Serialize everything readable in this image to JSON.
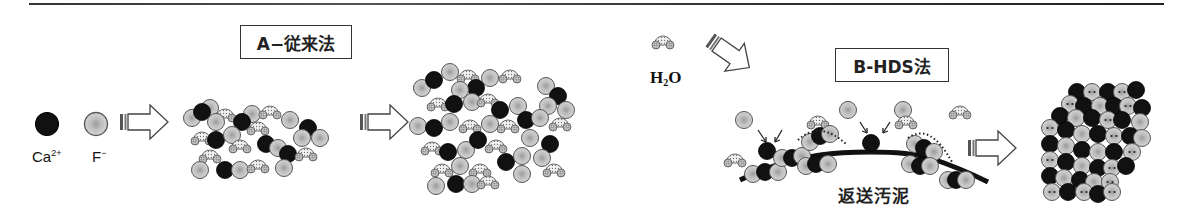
{
  "diagram": {
    "title_a": "A−従来法",
    "title_b": "B-HDS法",
    "legend": {
      "ca_label": "Ca",
      "ca_charge": "2+",
      "f_label": "F",
      "f_charge": "−"
    },
    "water": {
      "label_h": "H",
      "label_sub": "2",
      "label_o": "O"
    },
    "sludge_label": "返送汚泥",
    "colors": {
      "calcium": "#111111",
      "fluoride": "#c8c8c8",
      "fluoride_center": "#a8a8a8",
      "water_oxygen": "#e8e8e8",
      "water_hydrogen": "#b0b0b0",
      "outline": "#555555"
    },
    "stages": [
      {
        "name": "ions",
        "description": "Ca2+ and F- ions"
      },
      {
        "name": "conventional-floc",
        "description": "Loose floc with trapped water"
      },
      {
        "name": "conventional-aggregate",
        "description": "Large loose aggregate"
      },
      {
        "name": "hds-seeding",
        "description": "Ions deposit on returned sludge"
      },
      {
        "name": "hds-crystal",
        "description": "Dense crystalline CaF2"
      }
    ]
  }
}
